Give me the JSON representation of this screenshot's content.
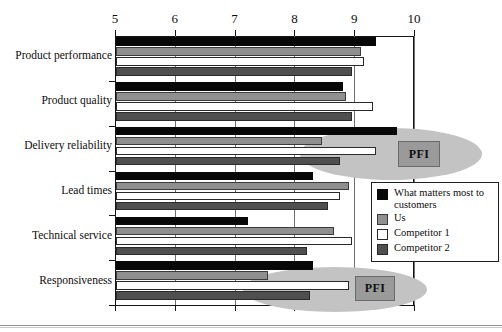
{
  "chart_data": {
    "type": "bar",
    "orientation": "horizontal",
    "title": "",
    "subtitle": "",
    "xlabel": "",
    "ylabel": "",
    "xlim": [
      5,
      10
    ],
    "ylim": null,
    "grid": true,
    "legend_position": "inside-right",
    "xticks": [
      "5",
      "6",
      "7",
      "8",
      "9",
      "10"
    ],
    "xtick_values": [
      5,
      6,
      7,
      8,
      9,
      10
    ],
    "categories": [
      "Product performance",
      "Product quality",
      "Delivery reliability",
      "Lead times",
      "Technical service",
      "Responsiveness"
    ],
    "series": [
      {
        "name": "What matters most to customers",
        "color": "#080808",
        "values": [
          9.35,
          8.8,
          9.7,
          8.3,
          7.2,
          8.3
        ]
      },
      {
        "name": "Us",
        "color": "#8f8f8f",
        "values": [
          9.1,
          8.85,
          8.45,
          8.9,
          8.65,
          7.55
        ]
      },
      {
        "name": "Competitor 1",
        "color": "#ffffff",
        "values": [
          9.15,
          9.3,
          9.35,
          8.75,
          8.95,
          8.9
        ]
      },
      {
        "name": "Competitor 2",
        "color": "#4f4f4f",
        "values": [
          8.95,
          8.95,
          8.75,
          8.55,
          8.2,
          8.25
        ]
      }
    ],
    "annotations": [
      {
        "label": "PFI",
        "category": "Delivery reliability"
      },
      {
        "label": "PFI",
        "category": "Responsiveness"
      }
    ]
  },
  "legend": {
    "entries": [
      {
        "label": "What matters most to customers",
        "swatch": "black-square-icon"
      },
      {
        "label": "Us",
        "swatch": "gray-square-icon"
      },
      {
        "label": "Competitor 1",
        "swatch": "white-square-icon"
      },
      {
        "label": "Competitor 2",
        "swatch": "dark-gray-square-icon"
      }
    ]
  },
  "colors": {
    "matters": "#080808",
    "us": "#8f8f8f",
    "competitor1": "#ffffff",
    "competitor2": "#4f4f4f",
    "ellipse": "#c3c3c3",
    "pfi_box": "#9a9a9a",
    "axis": "#151515",
    "gridline": "#6f6f6f"
  }
}
